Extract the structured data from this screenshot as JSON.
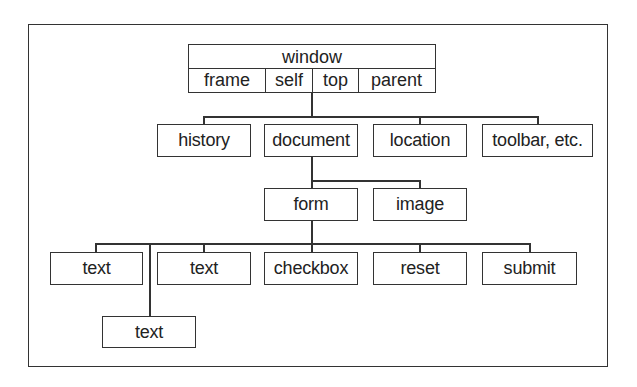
{
  "diagram": {
    "type": "tree",
    "root": {
      "label": "window",
      "properties": [
        "frame",
        "self",
        "top",
        "parent"
      ]
    },
    "level1": [
      "history",
      "document",
      "location",
      "toolbar, etc."
    ],
    "level2": [
      "form",
      "image"
    ],
    "level3": [
      "text",
      "text",
      "checkbox",
      "reset",
      "submit"
    ],
    "level4": [
      "text"
    ],
    "edges": [
      [
        "window",
        "history"
      ],
      [
        "window",
        "document"
      ],
      [
        "window",
        "location"
      ],
      [
        "window",
        "toolbar, etc."
      ],
      [
        "document",
        "form"
      ],
      [
        "document",
        "image"
      ],
      [
        "form",
        "text"
      ],
      [
        "form",
        "text"
      ],
      [
        "form",
        "text"
      ],
      [
        "form",
        "checkbox"
      ],
      [
        "form",
        "reset"
      ],
      [
        "form",
        "submit"
      ]
    ]
  }
}
